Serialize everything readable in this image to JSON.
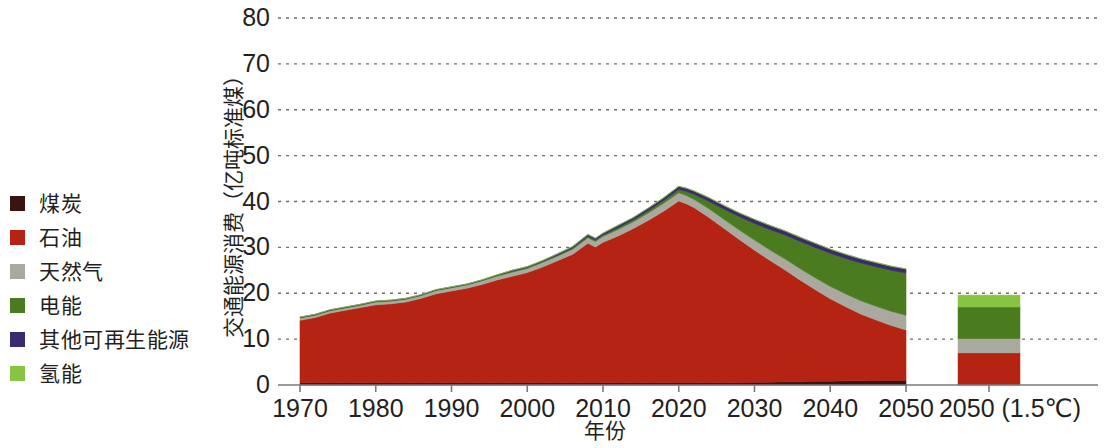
{
  "legend": {
    "items": [
      {
        "label": "煤炭",
        "color": "#3a1410",
        "key": "coal"
      },
      {
        "label": "石油",
        "color": "#b52413",
        "key": "oil"
      },
      {
        "label": "天然气",
        "color": "#a9a9a0",
        "key": "gas"
      },
      {
        "label": "电能",
        "color": "#4a7c1f",
        "key": "electricity"
      },
      {
        "label": "其他可再生能源",
        "color": "#3a2a6e",
        "key": "other_renewables"
      },
      {
        "label": "氢能",
        "color": "#86c442",
        "key": "hydrogen"
      }
    ]
  },
  "chart_data": {
    "type": "area",
    "stacked": true,
    "title": "",
    "xlabel": "年份",
    "ylabel": "交通能源消费（亿吨标准煤）",
    "ylim": [
      0,
      80
    ],
    "yticks": [
      0,
      10,
      20,
      30,
      40,
      50,
      60,
      70,
      80
    ],
    "grid": true,
    "grid_style": "dotted",
    "xlim": [
      1970,
      2050
    ],
    "xticks": [
      1970,
      1980,
      1990,
      2000,
      2010,
      2020,
      2030,
      2040,
      2050
    ],
    "xtick_labels": [
      "1970",
      "1980",
      "1990",
      "2000",
      "2010",
      "2020",
      "2030",
      "2040",
      "2050"
    ],
    "extra_category_label": "2050 (1.5℃)",
    "legend_position": "outside-left",
    "units": "亿吨标准煤",
    "x": [
      1970,
      1972,
      1974,
      1976,
      1978,
      1980,
      1982,
      1984,
      1986,
      1988,
      1990,
      1992,
      1994,
      1996,
      1998,
      2000,
      2002,
      2004,
      2006,
      2008,
      2009,
      2010,
      2012,
      2014,
      2016,
      2018,
      2020,
      2021,
      2022,
      2024,
      2026,
      2028,
      2030,
      2032,
      2034,
      2036,
      2038,
      2040,
      2042,
      2044,
      2046,
      2048,
      2050
    ],
    "series": [
      {
        "name": "煤炭",
        "color": "#3a1410",
        "values": [
          0.5,
          0.5,
          0.5,
          0.5,
          0.5,
          0.5,
          0.5,
          0.5,
          0.5,
          0.5,
          0.5,
          0.5,
          0.5,
          0.5,
          0.5,
          0.5,
          0.5,
          0.5,
          0.5,
          0.5,
          0.5,
          0.5,
          0.5,
          0.5,
          0.5,
          0.5,
          0.5,
          0.5,
          0.5,
          0.5,
          0.5,
          0.5,
          0.6,
          0.6,
          0.7,
          0.7,
          0.8,
          0.8,
          0.9,
          0.9,
          1.0,
          1.0,
          1.0
        ]
      },
      {
        "name": "石油",
        "color": "#b52413",
        "values": [
          13.6,
          14.2,
          15.2,
          15.8,
          16.4,
          17.0,
          17.2,
          17.6,
          18.4,
          19.4,
          20.0,
          20.6,
          21.4,
          22.4,
          23.2,
          24.0,
          25.2,
          26.6,
          28.0,
          30.4,
          29.6,
          30.6,
          32.0,
          33.6,
          35.4,
          37.4,
          39.6,
          39.0,
          38.2,
          36.0,
          33.6,
          31.2,
          28.8,
          26.6,
          24.4,
          22.2,
          20.0,
          18.0,
          16.2,
          14.6,
          13.2,
          12.0,
          11.0
        ]
      },
      {
        "name": "天然气",
        "color": "#a9a9a0",
        "values": [
          0.5,
          0.5,
          0.5,
          0.5,
          0.5,
          0.6,
          0.6,
          0.6,
          0.6,
          0.7,
          0.7,
          0.7,
          0.8,
          0.8,
          0.9,
          0.9,
          1.0,
          1.0,
          1.1,
          1.2,
          1.2,
          1.3,
          1.4,
          1.5,
          1.6,
          1.7,
          1.8,
          1.8,
          1.8,
          1.9,
          2.0,
          2.1,
          2.2,
          2.3,
          2.4,
          2.5,
          2.6,
          2.7,
          2.8,
          2.9,
          3.0,
          3.1,
          3.2
        ]
      },
      {
        "name": "电能",
        "color": "#4a7c1f",
        "values": [
          0.1,
          0.1,
          0.1,
          0.1,
          0.1,
          0.1,
          0.1,
          0.1,
          0.1,
          0.1,
          0.1,
          0.1,
          0.1,
          0.2,
          0.2,
          0.2,
          0.2,
          0.2,
          0.3,
          0.3,
          0.3,
          0.3,
          0.4,
          0.4,
          0.5,
          0.6,
          0.7,
          0.9,
          1.1,
          1.6,
          2.2,
          2.9,
          3.6,
          4.4,
          5.2,
          5.9,
          6.6,
          7.2,
          7.7,
          8.2,
          8.6,
          8.9,
          9.2
        ]
      },
      {
        "name": "其他可再生能源",
        "color": "#3a2a6e",
        "values": [
          0.1,
          0.1,
          0.1,
          0.1,
          0.1,
          0.1,
          0.1,
          0.1,
          0.1,
          0.1,
          0.1,
          0.1,
          0.1,
          0.1,
          0.2,
          0.2,
          0.2,
          0.3,
          0.3,
          0.4,
          0.4,
          0.4,
          0.5,
          0.5,
          0.6,
          0.6,
          0.7,
          0.7,
          0.7,
          0.8,
          0.8,
          0.8,
          0.9,
          0.9,
          0.9,
          0.9,
          0.9,
          0.9,
          0.9,
          0.9,
          0.9,
          0.9,
          0.9
        ]
      },
      {
        "name": "氢能",
        "color": "#86c442",
        "values": [
          0,
          0,
          0,
          0,
          0,
          0,
          0,
          0,
          0,
          0,
          0,
          0,
          0,
          0,
          0,
          0,
          0,
          0,
          0,
          0,
          0,
          0,
          0,
          0,
          0,
          0,
          0,
          0,
          0,
          0,
          0,
          0,
          0,
          0,
          0,
          0,
          0,
          0,
          0,
          0,
          0,
          0,
          0
        ]
      }
    ],
    "scenario_bar": {
      "label": "2050 (1.5℃)",
      "total": 19.6,
      "segments": [
        {
          "name": "煤炭",
          "color": "#3a1410",
          "value": 0.0
        },
        {
          "name": "石油",
          "color": "#b52413",
          "value": 7.0
        },
        {
          "name": "天然气",
          "color": "#a9a9a0",
          "value": 3.1
        },
        {
          "name": "电能",
          "color": "#4a7c1f",
          "value": 6.9
        },
        {
          "name": "其他可再生能源",
          "color": "#3a2a6e",
          "value": 0.0
        },
        {
          "name": "氢能",
          "color": "#86c442",
          "value": 2.6
        }
      ]
    },
    "notes": {
      "peak_year": 2020,
      "peak_value": 41.2,
      "start_value": 14.8,
      "end_value_2050": 25.3
    }
  }
}
